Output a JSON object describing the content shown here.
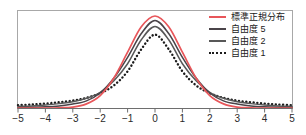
{
  "chart_data": {
    "type": "line",
    "title": "",
    "xlabel": "",
    "ylabel": "",
    "xlim": [
      -5,
      5
    ],
    "ylim": [
      0,
      0.42
    ],
    "grid": false,
    "legend_position": "top-right",
    "xticks": [
      "-5",
      "-4",
      "-3",
      "-2",
      "-1",
      "0",
      "1",
      "2",
      "3",
      "4",
      "5"
    ],
    "xtick_values": [
      -5,
      -4,
      -3,
      -2,
      -1,
      0,
      1,
      2,
      3,
      4,
      5
    ],
    "series": [
      {
        "name": "標準正規分布",
        "color": "#e8565a",
        "style": "solid",
        "peak": 0.399,
        "x": [
          -5,
          -4.5,
          -4,
          -3.5,
          -3,
          -2.5,
          -2,
          -1.5,
          -1,
          -0.5,
          0,
          0.5,
          1,
          1.5,
          2,
          2.5,
          3,
          3.5,
          4,
          4.5,
          5
        ],
        "values": [
          0.0,
          0.0,
          0.0,
          0.001,
          0.004,
          0.018,
          0.054,
          0.13,
          0.242,
          0.352,
          0.399,
          0.352,
          0.242,
          0.13,
          0.054,
          0.018,
          0.004,
          0.001,
          0.0,
          0.0,
          0.0
        ]
      },
      {
        "name": "自由度 5",
        "color": "#4a4449",
        "style": "solid",
        "peak": 0.38,
        "x": [
          -5,
          -4.5,
          -4,
          -3.5,
          -3,
          -2.5,
          -2,
          -1.5,
          -1,
          -0.5,
          0,
          0.5,
          1,
          1.5,
          2,
          2.5,
          3,
          3.5,
          4,
          4.5,
          5
        ],
        "values": [
          0.002,
          0.003,
          0.005,
          0.009,
          0.017,
          0.031,
          0.065,
          0.13,
          0.22,
          0.323,
          0.38,
          0.323,
          0.22,
          0.13,
          0.065,
          0.031,
          0.017,
          0.009,
          0.005,
          0.003,
          0.002
        ]
      },
      {
        "name": "自由度 2",
        "color": "#585858",
        "style": "solid",
        "peak": 0.354,
        "x": [
          -5,
          -4.5,
          -4,
          -3.5,
          -3,
          -2.5,
          -2,
          -1.5,
          -1,
          -0.5,
          0,
          0.5,
          1,
          1.5,
          2,
          2.5,
          3,
          3.5,
          4,
          4.5,
          5
        ],
        "values": [
          0.007,
          0.009,
          0.013,
          0.019,
          0.027,
          0.042,
          0.068,
          0.118,
          0.192,
          0.296,
          0.354,
          0.296,
          0.192,
          0.118,
          0.068,
          0.042,
          0.027,
          0.019,
          0.013,
          0.009,
          0.007
        ]
      },
      {
        "name": "自由度 1",
        "color": "#1c1c1c",
        "style": "dotted",
        "peak": 0.318,
        "x": [
          -5,
          -4.5,
          -4,
          -3.5,
          -3,
          -2.5,
          -2,
          -1.5,
          -1,
          -0.5,
          0,
          0.5,
          1,
          1.5,
          2,
          2.5,
          3,
          3.5,
          4,
          4.5,
          5
        ],
        "values": [
          0.012,
          0.015,
          0.019,
          0.025,
          0.032,
          0.044,
          0.064,
          0.098,
          0.159,
          0.255,
          0.318,
          0.255,
          0.159,
          0.098,
          0.064,
          0.044,
          0.032,
          0.025,
          0.019,
          0.015,
          0.012
        ]
      }
    ]
  },
  "legend": {
    "items": [
      {
        "label": "標準正規分布",
        "color": "#e8565a",
        "style": "solid"
      },
      {
        "label": "自由度 5",
        "color": "#4a4449",
        "style": "solid"
      },
      {
        "label": "自由度 2",
        "color": "#585858",
        "style": "solid"
      },
      {
        "label": "自由度 1",
        "color": "#1c1c1c",
        "style": "dotted"
      }
    ]
  },
  "axis": {
    "frame_color": "#a8a8a8",
    "baseline_color": "#6e6e6e",
    "tick_labels": [
      "-5",
      "-4",
      "-3",
      "-2",
      "-1",
      "0",
      "1",
      "2",
      "3",
      "4",
      "5"
    ]
  }
}
